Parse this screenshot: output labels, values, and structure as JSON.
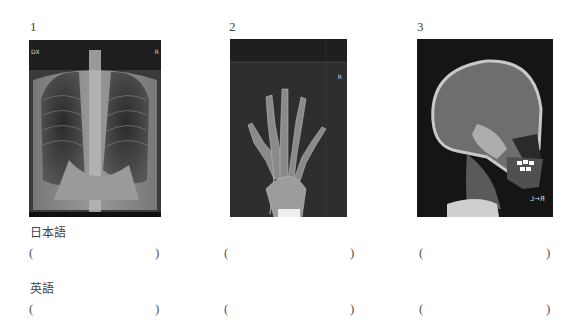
{
  "figures": [
    {
      "number": "1",
      "subject": "chest-xray",
      "corner_left": "DX",
      "corner_right": "R"
    },
    {
      "number": "2",
      "subject": "hand-xray",
      "corner_right": "R"
    },
    {
      "number": "3",
      "subject": "skull-lateral-xray",
      "orientation_marker": "R←L"
    }
  ],
  "sections": [
    {
      "label": "日本語",
      "answers": [
        {
          "open": "(",
          "value": "",
          "close": ")"
        },
        {
          "open": "(",
          "value": "",
          "close": ")"
        },
        {
          "open": "(",
          "value": "",
          "close": ")"
        }
      ]
    },
    {
      "label": "英語",
      "answers": [
        {
          "open": "(",
          "value": "",
          "close": ")"
        },
        {
          "open": "(",
          "value": "",
          "close": ")"
        },
        {
          "open": "(",
          "value": "",
          "close": ")"
        }
      ]
    }
  ]
}
